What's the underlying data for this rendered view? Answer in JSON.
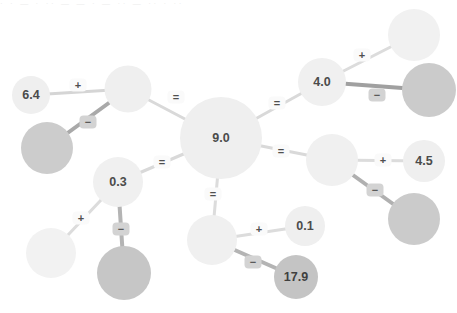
{
  "canvas": {
    "width": 457,
    "height": 313,
    "background": "#ffffff",
    "top_artifact_text": "· · — · ·· — — · — ·· — ·· · ··"
  },
  "palette": {
    "node_light": "#efefef",
    "node_lighter": "#f2f2f2",
    "node_gray": "#cccccc",
    "node_mid_gray": "#c6c6c6",
    "edge_light": "#d9d9d9",
    "edge_dark": "#9a9a9a",
    "chip_bg": "#fafafa",
    "chip_bg_dark": "#d3d3d3",
    "text": "#4b4b4b"
  },
  "graph": {
    "type": "node-link-equation-tree",
    "nodes": [
      {
        "id": "center",
        "label": "9.0",
        "cx": 221,
        "cy": 138,
        "r": 41,
        "fill": "#efefef",
        "labeled": true
      },
      {
        "id": "hub-left",
        "label": "",
        "cx": 128,
        "cy": 89,
        "r": 23.5,
        "fill": "#efefef",
        "labeled": false
      },
      {
        "id": "n-6-4",
        "label": "6.4",
        "cx": 31,
        "cy": 95,
        "r": 19,
        "fill": "#efefef",
        "labeled": true
      },
      {
        "id": "g-left",
        "label": "",
        "cx": 47,
        "cy": 148,
        "r": 26,
        "fill": "#cccccc",
        "labeled": false
      },
      {
        "id": "hub-tr",
        "label": "4.0",
        "cx": 322,
        "cy": 82,
        "r": 24,
        "fill": "#f0f0f0",
        "labeled": true
      },
      {
        "id": "n-tr-plus",
        "label": "",
        "cx": 414,
        "cy": 35,
        "r": 26,
        "fill": "#f1f1f1",
        "labeled": false
      },
      {
        "id": "g-tr",
        "label": "",
        "cx": 429,
        "cy": 90,
        "r": 27,
        "fill": "#cbcbcb",
        "labeled": false
      },
      {
        "id": "hub-right",
        "label": "",
        "cx": 332,
        "cy": 160,
        "r": 26,
        "fill": "#f0f0f0",
        "labeled": false
      },
      {
        "id": "n-4-5",
        "label": "4.5",
        "cx": 424,
        "cy": 161,
        "r": 21,
        "fill": "#efefef",
        "labeled": true
      },
      {
        "id": "g-right",
        "label": "",
        "cx": 414,
        "cy": 219,
        "r": 26,
        "fill": "#cbcbcb",
        "labeled": false
      },
      {
        "id": "hub-bl",
        "label": "0.3",
        "cx": 118,
        "cy": 182,
        "r": 25,
        "fill": "#f0f0f0",
        "labeled": true
      },
      {
        "id": "n-bl-plus",
        "label": "",
        "cx": 51,
        "cy": 253,
        "r": 25,
        "fill": "#f2f2f2",
        "labeled": false
      },
      {
        "id": "g-bl",
        "label": "",
        "cx": 124,
        "cy": 273,
        "r": 27,
        "fill": "#c6c6c6",
        "labeled": false
      },
      {
        "id": "hub-bot",
        "label": "",
        "cx": 212,
        "cy": 240,
        "r": 25,
        "fill": "#f0f0f0",
        "labeled": false
      },
      {
        "id": "n-0-1",
        "label": "0.1",
        "cx": 305,
        "cy": 226,
        "r": 20,
        "fill": "#efefef",
        "labeled": true
      },
      {
        "id": "n-17-9",
        "label": "17.9",
        "cx": 296,
        "cy": 277,
        "r": 22,
        "fill": "#c4c4c4",
        "labeled": true
      }
    ],
    "edges": [
      {
        "from": "center",
        "to": "hub-left",
        "label": "=",
        "lx": 176,
        "ly": 97,
        "stroke": "#d9d9d9",
        "width": 3,
        "chip": "light"
      },
      {
        "from": "hub-left",
        "to": "n-6-4",
        "label": "+",
        "lx": 78,
        "ly": 85,
        "stroke": "#d5d5d5",
        "width": 3,
        "chip": "light"
      },
      {
        "from": "hub-left",
        "to": "g-left",
        "label": "−",
        "lx": 88,
        "ly": 122,
        "stroke": "#a9a9a9",
        "width": 4,
        "chip": "dark"
      },
      {
        "from": "center",
        "to": "hub-tr",
        "label": "=",
        "lx": 277,
        "ly": 103,
        "stroke": "#d9d9d9",
        "width": 3,
        "chip": "light"
      },
      {
        "from": "hub-tr",
        "to": "n-tr-plus",
        "label": "+",
        "lx": 362,
        "ly": 55,
        "stroke": "#dcdcdc",
        "width": 3,
        "chip": "light"
      },
      {
        "from": "hub-tr",
        "to": "g-tr",
        "label": "−",
        "lx": 377,
        "ly": 95,
        "stroke": "#a0a0a0",
        "width": 4,
        "chip": "dark"
      },
      {
        "from": "center",
        "to": "hub-right",
        "label": "=",
        "lx": 281,
        "ly": 151,
        "stroke": "#d9d9d9",
        "width": 3,
        "chip": "light"
      },
      {
        "from": "hub-right",
        "to": "n-4-5",
        "label": "+",
        "lx": 383,
        "ly": 160,
        "stroke": "#dcdcdc",
        "width": 3,
        "chip": "light"
      },
      {
        "from": "hub-right",
        "to": "g-right",
        "label": "−",
        "lx": 375,
        "ly": 190,
        "stroke": "#b0b0b0",
        "width": 4,
        "chip": "dark"
      },
      {
        "from": "center",
        "to": "hub-bl",
        "label": "=",
        "lx": 162,
        "ly": 162,
        "stroke": "#d9d9d9",
        "width": 3,
        "chip": "light"
      },
      {
        "from": "hub-bl",
        "to": "n-bl-plus",
        "label": "+",
        "lx": 81,
        "ly": 218,
        "stroke": "#dcdcdc",
        "width": 3,
        "chip": "light"
      },
      {
        "from": "hub-bl",
        "to": "g-bl",
        "label": "−",
        "lx": 121,
        "ly": 229,
        "stroke": "#b4b4b4",
        "width": 4,
        "chip": "dark"
      },
      {
        "from": "center",
        "to": "hub-bot",
        "label": "=",
        "lx": 213,
        "ly": 194,
        "stroke": "#dcdcdc",
        "width": 3,
        "chip": "light"
      },
      {
        "from": "hub-bot",
        "to": "n-0-1",
        "label": "+",
        "lx": 259,
        "ly": 229,
        "stroke": "#dcdcdc",
        "width": 3,
        "chip": "light"
      },
      {
        "from": "hub-bot",
        "to": "n-17-9",
        "label": "−",
        "lx": 253,
        "ly": 262,
        "stroke": "#b4b4b4",
        "width": 4,
        "chip": "dark"
      }
    ]
  }
}
